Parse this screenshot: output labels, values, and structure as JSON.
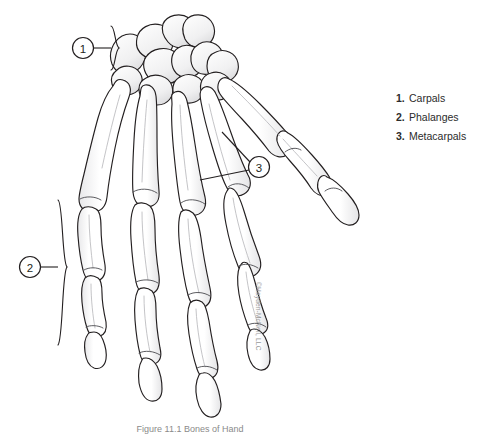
{
  "figure": {
    "caption": "Figure 11.1  Bones of Hand",
    "watermark": "©Hayden-McNeil, LLC"
  },
  "legend": {
    "items": [
      {
        "number": "1.",
        "label": "Carpals"
      },
      {
        "number": "2.",
        "label": "Phalanges"
      },
      {
        "number": "3.",
        "label": "Metacarpals"
      }
    ]
  },
  "callouts": [
    {
      "id": "1",
      "number": "1",
      "x": 83,
      "y": 48
    },
    {
      "id": "2",
      "number": "2",
      "x": 30,
      "y": 267
    },
    {
      "id": "3",
      "number": "3",
      "x": 259,
      "y": 167
    }
  ],
  "colors": {
    "outline": "#231f20",
    "bone_fill": "#ffffff",
    "shadow": "#d9d9dc",
    "shade_light": "#ececed",
    "background": "#ffffff",
    "text": "#2b2b2b",
    "caption_text": "#8a8a8a"
  }
}
